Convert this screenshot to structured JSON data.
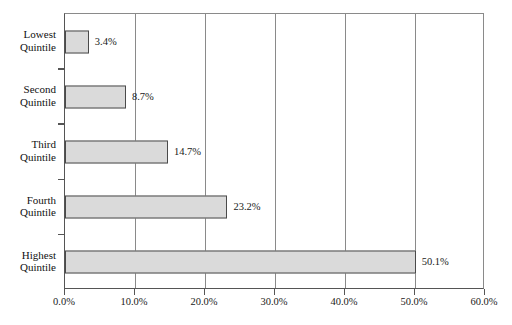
{
  "chart_data": {
    "type": "bar",
    "orientation": "horizontal",
    "title": "",
    "subtitle": "",
    "xlabel": "",
    "ylabel": "",
    "categories": [
      "Lowest Quintile",
      "Second Quintile",
      "Third Quintile",
      "Fourth Quintile",
      "Highest Quintile"
    ],
    "category_lines": [
      [
        "Lowest",
        "Quintile"
      ],
      [
        "Second",
        "Quintile"
      ],
      [
        "Third",
        "Quintile"
      ],
      [
        "Fourth",
        "Quintile"
      ],
      [
        "Highest",
        "Quintile"
      ]
    ],
    "values": [
      3.4,
      8.7,
      14.7,
      23.2,
      50.1
    ],
    "value_labels": [
      "3.4%",
      "8.7%",
      "14.7%",
      "23.2%",
      "50.1%"
    ],
    "xlim": [
      0,
      60
    ],
    "xticks": [
      0,
      10,
      20,
      30,
      40,
      50,
      60
    ],
    "xtick_labels": [
      "0.0%",
      "10.0%",
      "20.0%",
      "30.0%",
      "40.0%",
      "50.0%",
      "60.0%"
    ],
    "grid": "vertical",
    "legend": "none",
    "bar_fill_color": "#dadada",
    "bar_edge_color": "#4a4a4a",
    "gridline_color": "#8a8a8a",
    "axis_color": "#555555",
    "text_color": "#1a1a1a",
    "background_color": "#ffffff"
  }
}
